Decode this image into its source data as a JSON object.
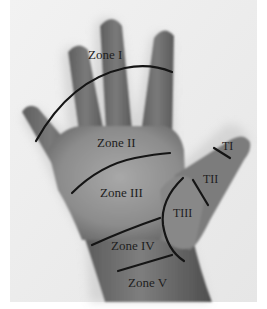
{
  "figure": {
    "colors": {
      "background": "#f4f4f4",
      "skin_dark": "#6e6e6e",
      "skin_mid": "#8a8a8a",
      "skin_light": "#a4a4a4",
      "line": "#151515",
      "text": "#1e1e1e"
    },
    "zone_labels": [
      {
        "id": "zone-1",
        "text": "Zone I"
      },
      {
        "id": "zone-2",
        "text": "Zone II"
      },
      {
        "id": "zone-3",
        "text": "Zone III"
      },
      {
        "id": "zone-4",
        "text": "Zone IV"
      },
      {
        "id": "zone-5",
        "text": "Zone V"
      }
    ],
    "thumb_labels": [
      {
        "id": "thumb-1",
        "text": "TI"
      },
      {
        "id": "thumb-2",
        "text": "TII"
      },
      {
        "id": "thumb-3",
        "text": "TIII"
      }
    ]
  }
}
